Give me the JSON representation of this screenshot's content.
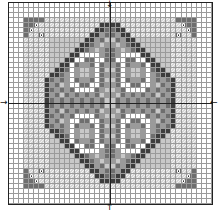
{
  "chart_title": "",
  "grid": {
    "cols": 40,
    "rows": 40
  },
  "palette": {
    ".": "#ffffff",
    "a": "#c8c8c8",
    "b": "#9a9a9a",
    "c": "#6e6e6e",
    "d": "#3c3c3c",
    "w": "#ffffff",
    "h": "hatched-light",
    "o": "dark-with-dot"
  },
  "quadrant_top_left": [
    "....................",
    "....................",
    "....................",
    "...cccchhhhhhhhhhhhh",
    "...ccohhhhhhhhhhhhdd",
    "...cohhhhhhhhhhhhddc",
    "...chhohhhhhhhhhddbc",
    "...hhhhhaaaaaaaddbca",
    "...hhhhhaaaaaaddcbab",
    "...hhhhhaaaaaddcbabc",
    "...hhhhhaaaaddwwwwbc",
    "...hhhhhaaaddwwccwwc",
    "...hhhhhaaddwcbbcwcb",
    "...hhhhhaddcwbaabwca",
    "...hhhhhddcbwbaabwcb",
    "...hhhhdcbcbwcbbcwca",
    "...hhhhdbcabwwccwwcb",
    "...hhhhdcbcbcwwwwcba",
    "...hhhhdbcacbcbcbcab",
    "...hhhhdcbcbcbcbcbca"
  ],
  "markers": {
    "top_arrow": "↓",
    "bottom_arrow": "↑",
    "left_arrow": "→",
    "right_arrow": "←"
  },
  "icons": {
    "center_marker": "arrow-icon"
  }
}
